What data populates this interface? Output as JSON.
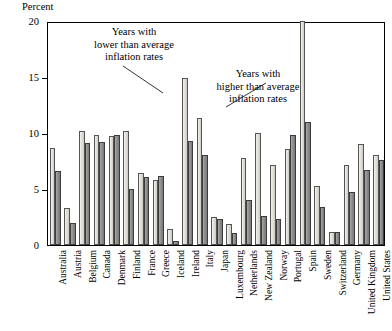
{
  "chart_data": {
    "type": "bar",
    "title": "",
    "ylabel": "Percent",
    "xlabel": "",
    "ylim": [
      0,
      20
    ],
    "yticks": [
      0,
      5,
      10,
      15,
      20
    ],
    "ytick_labels": [
      "0",
      "5",
      "10",
      "15",
      "20"
    ],
    "grid": false,
    "legend_position": "annotations",
    "annotations": [
      {
        "id": "low",
        "text": "Years with\nlower than average\ninflation rates",
        "points_to": "light-gray-bar"
      },
      {
        "id": "high",
        "text": "Years with\nhigher than average\ninflation rates",
        "points_to": "dark-gray-bar"
      }
    ],
    "categories": [
      "Australia",
      "Austria",
      "Belgium",
      "Canada",
      "Denmark",
      "Finland",
      "France",
      "Greece",
      "Iceland",
      "Ireland",
      "Italy",
      "Japan",
      "Luxembourg",
      "Netherlands",
      "New Zealand",
      "Norway",
      "Portugal",
      "Spain",
      "Sweden",
      "Switzerland",
      "Germany",
      "United Kingdom",
      "United States"
    ],
    "series": [
      {
        "name": "Years with lower than average inflation rates",
        "color": "#e3e0da",
        "values": [
          8.7,
          3.3,
          10.2,
          9.8,
          9.7,
          10.2,
          6.4,
          5.8,
          1.4,
          14.9,
          11.3,
          2.5,
          1.9,
          7.8,
          10.0,
          7.1,
          8.6,
          20.0,
          5.3,
          1.2,
          7.1,
          9.0,
          8.0
        ]
      },
      {
        "name": "Years with higher than average inflation rates",
        "color": "#8f8f8f",
        "values": [
          6.6,
          2.0,
          9.1,
          9.2,
          9.8,
          5.0,
          6.1,
          6.2,
          0.4,
          9.3,
          8.0,
          2.3,
          1.1,
          4.0,
          2.6,
          2.3,
          9.8,
          11.0,
          3.4,
          1.2,
          4.7,
          6.7,
          7.6
        ]
      }
    ]
  }
}
